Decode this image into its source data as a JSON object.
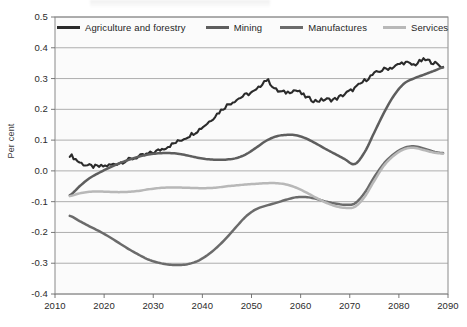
{
  "chart_data": {
    "type": "line",
    "title": "",
    "xlabel": "",
    "ylabel": "Per cent",
    "xlim": [
      2010,
      2090
    ],
    "ylim": [
      -0.4,
      0.5
    ],
    "grid": true,
    "legend_position": "top-inside",
    "xticks": [
      2010,
      2020,
      2030,
      2040,
      2050,
      2060,
      2070,
      2080,
      2090
    ],
    "xtick_labels": [
      "2010",
      "2020",
      "2030",
      "2040",
      "2050",
      "2060",
      "2070",
      "2080",
      "2090"
    ],
    "yticks": [
      0.5,
      0.4,
      0.3,
      0.2,
      0.1,
      0.0,
      -0.1,
      -0.2,
      -0.3,
      -0.4
    ],
    "ytick_labels": [
      "0.5",
      "0.4",
      "0.3",
      "0.2",
      "0.1",
      "0.0",
      "-0.1",
      "-0.2",
      "-0.3",
      "-0.4"
    ],
    "x": [
      2013,
      2015,
      2017,
      2019,
      2021,
      2023,
      2025,
      2027,
      2029,
      2031,
      2033,
      2035,
      2037,
      2039,
      2041,
      2043,
      2045,
      2047,
      2049,
      2051,
      2053,
      2055,
      2057,
      2059,
      2061,
      2063,
      2065,
      2067,
      2069,
      2071,
      2073,
      2075,
      2077,
      2079,
      2081,
      2083,
      2085,
      2087,
      2089
    ],
    "series": [
      {
        "name": "Agriculture and forestry",
        "color": "#2b2b2b",
        "values": [
          0.052,
          0.028,
          0.016,
          0.014,
          0.018,
          0.026,
          0.036,
          0.046,
          0.055,
          0.066,
          0.08,
          0.095,
          0.112,
          0.131,
          0.155,
          0.185,
          0.213,
          0.232,
          0.248,
          0.262,
          0.295,
          0.263,
          0.255,
          0.262,
          0.241,
          0.228,
          0.232,
          0.233,
          0.25,
          0.268,
          0.293,
          0.315,
          0.33,
          0.338,
          0.352,
          0.345,
          0.36,
          0.352,
          0.338
        ]
      },
      {
        "name": "Mining",
        "color": "#5e5e5e",
        "values": [
          -0.079,
          -0.05,
          -0.024,
          -0.006,
          0.01,
          0.024,
          0.036,
          0.046,
          0.053,
          0.057,
          0.058,
          0.056,
          0.05,
          0.043,
          0.038,
          0.036,
          0.037,
          0.042,
          0.055,
          0.076,
          0.098,
          0.112,
          0.117,
          0.116,
          0.106,
          0.09,
          0.072,
          0.055,
          0.038,
          0.022,
          0.06,
          0.125,
          0.19,
          0.245,
          0.283,
          0.3,
          0.312,
          0.324,
          0.336
        ]
      },
      {
        "name": "Manufactures",
        "color": "#6b6b6b",
        "values": [
          -0.146,
          -0.163,
          -0.18,
          -0.196,
          -0.214,
          -0.234,
          -0.254,
          -0.272,
          -0.288,
          -0.298,
          -0.304,
          -0.306,
          -0.303,
          -0.293,
          -0.274,
          -0.248,
          -0.216,
          -0.18,
          -0.146,
          -0.124,
          -0.113,
          -0.104,
          -0.094,
          -0.086,
          -0.085,
          -0.09,
          -0.099,
          -0.106,
          -0.11,
          -0.106,
          -0.072,
          -0.02,
          0.025,
          0.055,
          0.074,
          0.08,
          0.073,
          0.063,
          0.058
        ]
      },
      {
        "name": "Services",
        "color": "#b8b8b8",
        "values": [
          -0.082,
          -0.073,
          -0.068,
          -0.067,
          -0.068,
          -0.069,
          -0.068,
          -0.065,
          -0.06,
          -0.056,
          -0.054,
          -0.054,
          -0.055,
          -0.056,
          -0.056,
          -0.054,
          -0.05,
          -0.047,
          -0.044,
          -0.042,
          -0.04,
          -0.04,
          -0.044,
          -0.054,
          -0.069,
          -0.086,
          -0.102,
          -0.114,
          -0.12,
          -0.117,
          -0.085,
          -0.032,
          0.018,
          0.05,
          0.07,
          0.075,
          0.068,
          0.06,
          0.056
        ]
      }
    ]
  },
  "legend": {
    "items": [
      {
        "label": "Agriculture and forestry",
        "color": "#2b2b2b"
      },
      {
        "label": "Mining",
        "color": "#5e5e5e"
      },
      {
        "label": "Manufactures",
        "color": "#6b6b6b"
      },
      {
        "label": "Services",
        "color": "#b8b8b8"
      }
    ]
  },
  "axes": {
    "y_axis_title": "Per cent"
  }
}
